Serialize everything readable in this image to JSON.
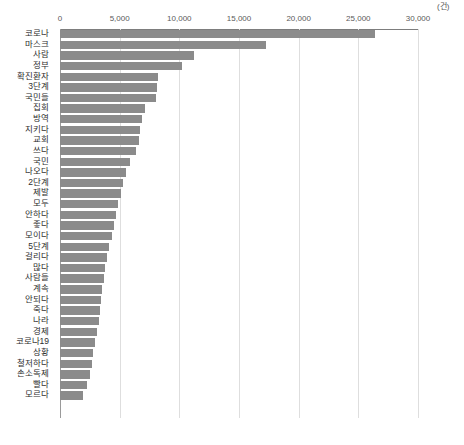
{
  "chart_data": {
    "type": "bar",
    "orientation": "horizontal",
    "title": "",
    "subtitle": "",
    "xlabel": "",
    "ylabel": "",
    "unit_label": "(건)",
    "xlim": [
      0,
      30000
    ],
    "xticks": [
      0,
      5000,
      10000,
      15000,
      20000,
      25000,
      30000
    ],
    "xtick_labels": [
      "0",
      "5,000",
      "10,000",
      "15,000",
      "20,000",
      "25,000",
      "30,000"
    ],
    "grid": true,
    "grid_axis": "x",
    "legend": false,
    "bar_color": "#8b8b8b",
    "axis_color": "#7d7d7d",
    "grid_color": "#dedede",
    "categories": [
      "코로나",
      "마스크",
      "사람",
      "정부",
      "확진환자",
      "3단계",
      "국민들",
      "집회",
      "방역",
      "지키다",
      "교회",
      "쓰다",
      "국민",
      "나오다",
      "2단계",
      "제발",
      "모두",
      "안하다",
      "좋다",
      "모이다",
      "5단계",
      "걸리다",
      "많다",
      "사람들",
      "계속",
      "안되다",
      "죽다",
      "나라",
      "경제",
      "코로나19",
      "상황",
      "철저하다",
      "손소독제",
      "빨다",
      "모르다"
    ],
    "values": [
      26400,
      17300,
      11200,
      10200,
      8200,
      8100,
      8050,
      7100,
      6900,
      6700,
      6600,
      6400,
      5900,
      5500,
      5300,
      5100,
      4900,
      4700,
      4550,
      4350,
      4100,
      3950,
      3800,
      3700,
      3550,
      3450,
      3350,
      3250,
      3100,
      2950,
      2800,
      2650,
      2500,
      2300,
      1900
    ]
  }
}
